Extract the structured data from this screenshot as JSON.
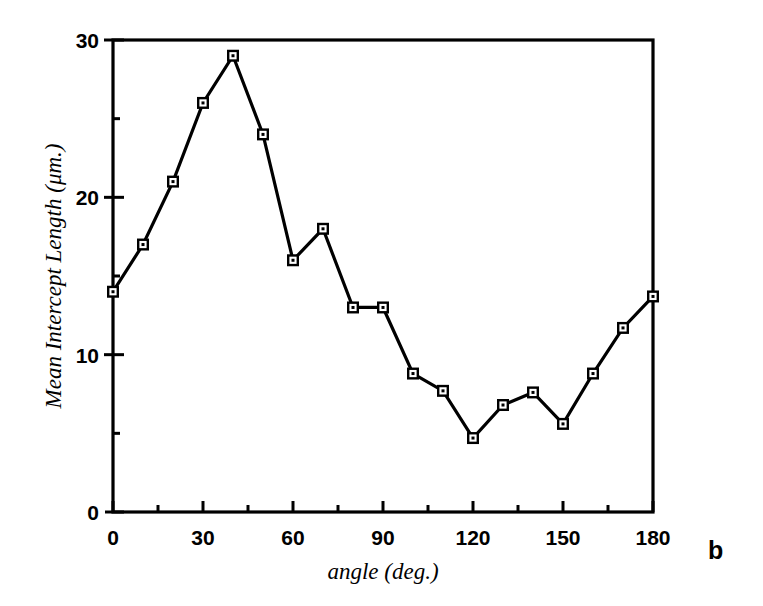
{
  "panel": {
    "label": "b"
  },
  "chart_data": {
    "type": "line",
    "title": "",
    "subtitle": "",
    "xlabel": "angle (deg.)",
    "ylabel": "Mean Intercept Length (μm.)",
    "xlim": [
      0,
      180
    ],
    "ylim": [
      0,
      30
    ],
    "grid": false,
    "legend": "none",
    "marker": "open-square",
    "line_color": "#000000",
    "x_major_ticks": [
      0,
      30,
      60,
      90,
      120,
      150,
      180
    ],
    "x_minor_ticks": [
      15,
      45,
      75,
      105,
      135,
      165
    ],
    "y_major_ticks": [
      0,
      10,
      20,
      30
    ],
    "y_minor_ticks": [
      5,
      15,
      25
    ],
    "x_tick_labels": [
      "0",
      "30",
      "60",
      "90",
      "120",
      "150",
      "180"
    ],
    "y_tick_labels": [
      "0",
      "10",
      "20",
      "30"
    ],
    "x": [
      0,
      10,
      20,
      30,
      40,
      50,
      60,
      70,
      80,
      90,
      100,
      110,
      120,
      130,
      140,
      150,
      160,
      170,
      180
    ],
    "values": [
      14.0,
      17.0,
      21.0,
      26.0,
      29.0,
      24.0,
      16.0,
      18.0,
      13.0,
      13.0,
      8.8,
      7.7,
      4.7,
      6.8,
      7.6,
      5.6,
      8.8,
      11.7,
      13.7
    ],
    "series": [
      {
        "name": "Mean Intercept Length",
        "values": [
          14.0,
          17.0,
          21.0,
          26.0,
          29.0,
          24.0,
          16.0,
          18.0,
          13.0,
          13.0,
          8.8,
          7.7,
          4.7,
          6.8,
          7.6,
          5.6,
          8.8,
          11.7,
          13.7
        ]
      }
    ]
  }
}
